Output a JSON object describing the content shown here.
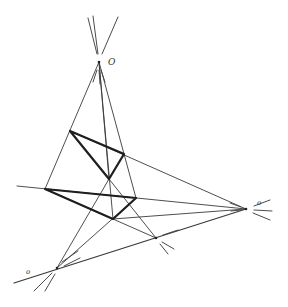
{
  "diagram": {
    "colors": {
      "line": "#3a3a3a",
      "thick": "#1e1e1e",
      "background": "#ffffff"
    },
    "points": {
      "O": {
        "x": 99,
        "y": 62,
        "label": "O"
      },
      "A1": {
        "x": 70,
        "y": 131
      },
      "B1": {
        "x": 124,
        "y": 154
      },
      "C1": {
        "x": 109,
        "y": 179
      },
      "A2": {
        "x": 45,
        "y": 189
      },
      "B2": {
        "x": 136,
        "y": 198
      },
      "C2": {
        "x": 113,
        "y": 219
      },
      "P": {
        "x": 246,
        "y": 209,
        "label": "o"
      },
      "Q": {
        "x": 156,
        "y": 238
      },
      "R": {
        "x": 57,
        "y": 268,
        "label": "o"
      }
    },
    "labels": [
      {
        "text": "O",
        "x": 108,
        "y": 65,
        "size": "normal"
      },
      {
        "text": "o",
        "x": 257,
        "y": 205,
        "size": "small"
      },
      {
        "text": "o",
        "x": 26,
        "y": 274,
        "size": "small"
      }
    ]
  }
}
